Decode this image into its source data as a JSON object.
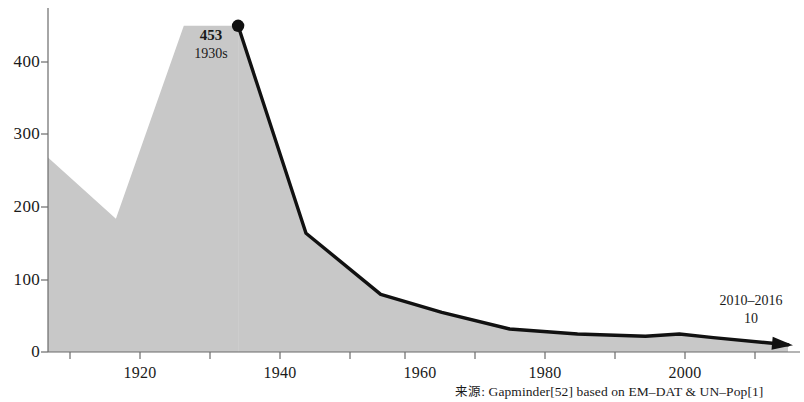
{
  "chart_data": {
    "type": "area",
    "title": "",
    "subtitle": "",
    "xlabel": "",
    "ylabel": "",
    "xlim": [
      1907,
      2016
    ],
    "ylim": [
      0,
      470
    ],
    "grid": false,
    "legend": "none",
    "x_ticks": [
      "1920",
      "1940",
      "1960",
      "1980",
      "2000"
    ],
    "x_tick_values": [
      1920,
      1940,
      1960,
      1980,
      2000
    ],
    "y_ticks": [
      "0",
      "100",
      "200",
      "300",
      "400"
    ],
    "y_tick_values": [
      0,
      100,
      200,
      300,
      400
    ],
    "series": [
      {
        "name": "Deaths per year (thousands)",
        "x": [
          1907,
          1917,
          1927,
          1935,
          1945,
          1956,
          1965,
          1975,
          1985,
          1995,
          2000,
          2005,
          2016
        ],
        "values": [
          270,
          185,
          453,
          453,
          165,
          80,
          55,
          32,
          25,
          22,
          25,
          20,
          10
        ]
      }
    ],
    "annotations": [
      {
        "name": "peak",
        "value": "453",
        "label": "1930s",
        "x": 1933,
        "y": 453
      },
      {
        "name": "end",
        "value": "10",
        "label": "2010–2016",
        "x": 2013,
        "y": 10
      }
    ],
    "marker_points": [
      {
        "x": 1935,
        "y": 453
      }
    ],
    "fill_color": "#c8c8c8",
    "line_color": "#111111",
    "axis_color": "#555555"
  },
  "source": {
    "prefix": "来源",
    "text": ": Gapminder[52] based on EM–DAT & UN–Pop[1]"
  },
  "annotations": {
    "peak_value": "453",
    "peak_label": "1930s",
    "end_label": "2010–2016",
    "end_value": "10"
  },
  "axis": {
    "y_labels": [
      "400",
      "300",
      "200",
      "100",
      "0"
    ],
    "x_labels": [
      "1920",
      "1940",
      "1960",
      "1980",
      "2000"
    ]
  }
}
